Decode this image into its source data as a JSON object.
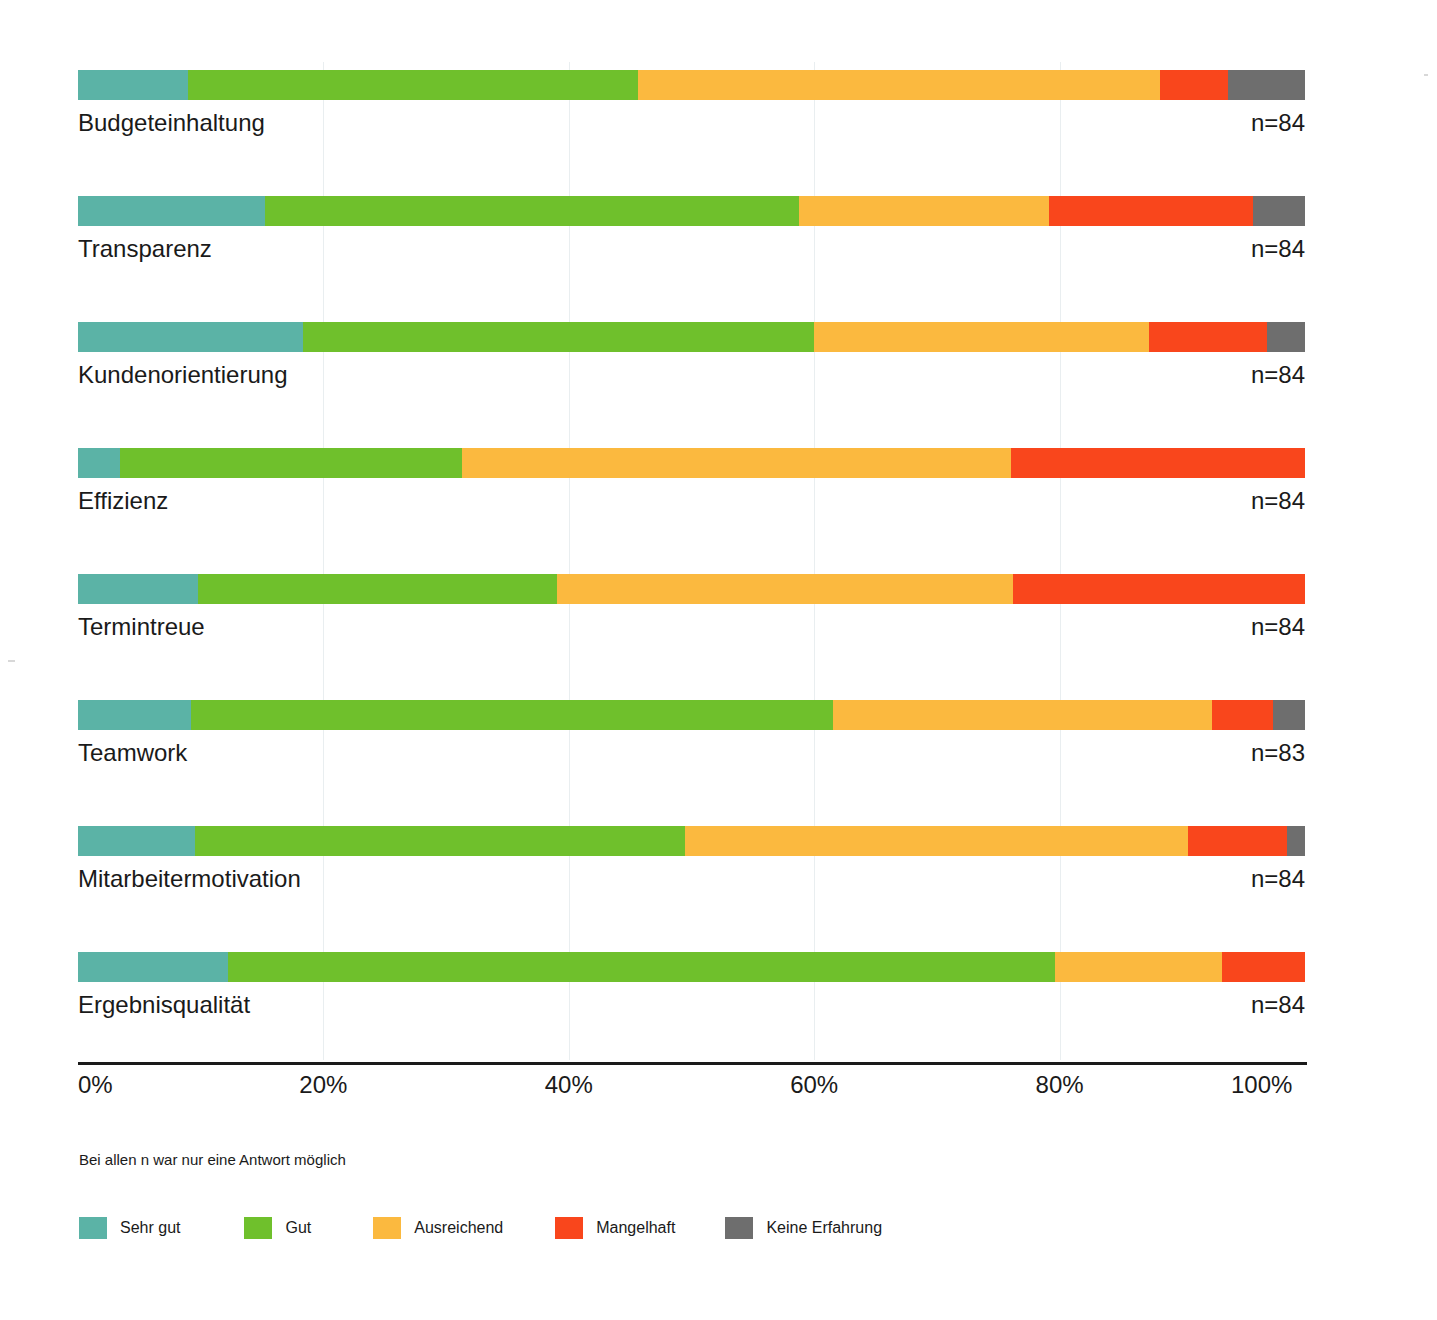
{
  "chart_data": {
    "type": "bar",
    "subtype": "stacked-horizontal-100percent",
    "title": "",
    "xlabel": "",
    "ylabel": "",
    "xlim": [
      0,
      100
    ],
    "xticks": [
      "0%",
      "20%",
      "40%",
      "60%",
      "80%",
      "100%"
    ],
    "xtick_values": [
      0,
      20,
      40,
      60,
      80,
      100
    ],
    "grid": true,
    "legend_position": "bottom-left",
    "categories": [
      "Budgeteinhaltung",
      "Transparenz",
      "Kundenorientierung",
      "Effizienz",
      "Termintreue",
      "Teamwork",
      "Mitarbeitermotivation",
      "Ergebnisqualität"
    ],
    "series": [
      {
        "name": "Sehr gut",
        "color": "#5bb3a6",
        "values": [
          9.0,
          15.2,
          18.3,
          3.4,
          9.8,
          9.2,
          9.5,
          12.2
        ]
      },
      {
        "name": "Gut",
        "color": "#6fc02c",
        "values": [
          36.6,
          43.6,
          41.7,
          27.9,
          29.2,
          52.3,
          40.0,
          67.4
        ]
      },
      {
        "name": "Ausreichend",
        "color": "#fbb93f",
        "values": [
          42.6,
          20.3,
          27.3,
          44.7,
          37.2,
          30.9,
          41.0,
          13.6
        ]
      },
      {
        "name": "Mangelhaft",
        "color": "#f9461c",
        "values": [
          5.5,
          16.7,
          9.6,
          24.0,
          23.8,
          5.0,
          8.0,
          6.8
        ]
      },
      {
        "name": "Keine Erfahrung",
        "color": "#6e6e6e",
        "values": [
          6.3,
          4.2,
          3.1,
          0.0,
          0.0,
          2.6,
          1.5,
          0.0
        ]
      }
    ],
    "n_labels": [
      "n=84",
      "n=84",
      "n=84",
      "n=84",
      "n=84",
      "n=83",
      "n=84",
      "n=84"
    ],
    "footnote": "Bei allen n war nur eine Antwort möglich"
  },
  "legend": {
    "items": [
      {
        "label": "Sehr gut",
        "color": "#5bb3a6"
      },
      {
        "label": "Gut",
        "color": "#6fc02c"
      },
      {
        "label": "Ausreichend",
        "color": "#fbb93f"
      },
      {
        "label": "Mangelhaft",
        "color": "#f9461c"
      },
      {
        "label": "Keine Erfahrung",
        "color": "#6e6e6e"
      }
    ]
  }
}
